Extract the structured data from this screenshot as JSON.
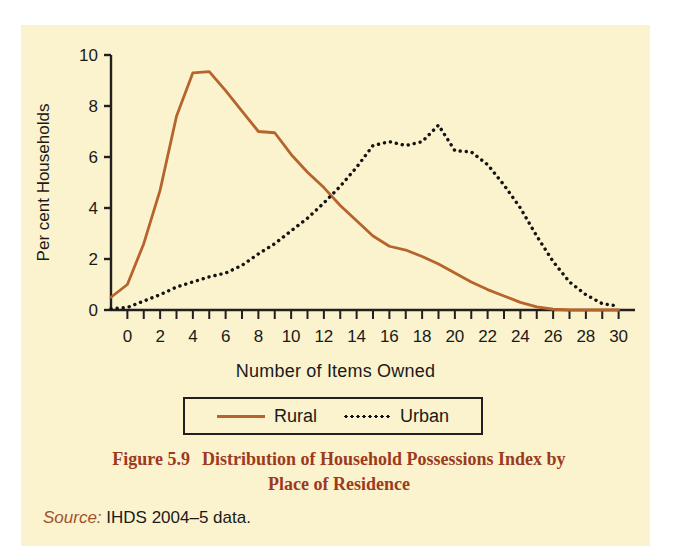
{
  "figure": {
    "caption_number": "Figure 5.9",
    "caption_line1": "Distribution of Household Possessions Index by",
    "caption_line2": "Place of Residence",
    "source_word": "Source:",
    "source_text": "IHDS 2004–5 data.",
    "background_color": "#fbf3cd",
    "caption_color": "#9c3a1e"
  },
  "legend": {
    "items": [
      {
        "label": "Rural",
        "style": "solid",
        "color": "#b5642c"
      },
      {
        "label": "Urban",
        "style": "dotted",
        "color": "#141414"
      }
    ]
  },
  "chart_data": {
    "type": "line",
    "title": "Distribution of Household Possessions Index by Place of Residence",
    "xlabel": "Number of Items Owned",
    "ylabel": "Per cent Households",
    "xlim": [
      -1,
      31
    ],
    "ylim": [
      0,
      10
    ],
    "xticks": [
      0,
      1,
      2,
      3,
      4,
      5,
      6,
      7,
      8,
      9,
      10,
      11,
      12,
      13,
      14,
      15,
      16,
      17,
      18,
      19,
      20,
      21,
      22,
      23,
      24,
      25,
      26,
      27,
      28,
      29,
      30
    ],
    "xtick_labels": [
      "0",
      "",
      "2",
      "",
      "4",
      "",
      "6",
      "",
      "8",
      "",
      "10",
      "",
      "12",
      "",
      "14",
      "",
      "16",
      "",
      "18",
      "",
      "20",
      "",
      "22",
      "",
      "24",
      "",
      "26",
      "",
      "28",
      "",
      "30"
    ],
    "yticks": [
      0,
      2,
      4,
      6,
      8,
      10
    ],
    "ytick_labels": [
      "0",
      "2",
      "4",
      "6",
      "8",
      "10"
    ],
    "grid": false,
    "legend_position": "below-axis",
    "x": [
      -1,
      0,
      1,
      2,
      3,
      4,
      5,
      6,
      7,
      8,
      9,
      10,
      11,
      12,
      13,
      14,
      15,
      16,
      17,
      18,
      19,
      20,
      21,
      22,
      23,
      24,
      25,
      26,
      27,
      28,
      29,
      30
    ],
    "series": [
      {
        "name": "Rural",
        "color": "#b5642c",
        "style": "solid",
        "values": [
          0.5,
          1.0,
          2.6,
          4.7,
          7.6,
          9.3,
          9.35,
          8.6,
          7.8,
          7.0,
          6.95,
          6.1,
          5.4,
          4.8,
          4.1,
          3.5,
          2.9,
          2.5,
          2.35,
          2.1,
          1.8,
          1.45,
          1.1,
          0.8,
          0.55,
          0.3,
          0.12,
          0.03,
          0.0,
          0.0,
          0.0,
          0.0
        ]
      },
      {
        "name": "Urban",
        "color": "#141414",
        "style": "dotted",
        "values": [
          0.05,
          0.1,
          0.35,
          0.6,
          0.9,
          1.1,
          1.3,
          1.45,
          1.75,
          2.2,
          2.6,
          3.1,
          3.6,
          4.2,
          4.85,
          5.6,
          6.45,
          6.6,
          6.45,
          6.6,
          7.25,
          6.25,
          6.2,
          5.7,
          4.9,
          4.0,
          2.9,
          1.9,
          1.1,
          0.6,
          0.25,
          0.15
        ]
      }
    ]
  }
}
